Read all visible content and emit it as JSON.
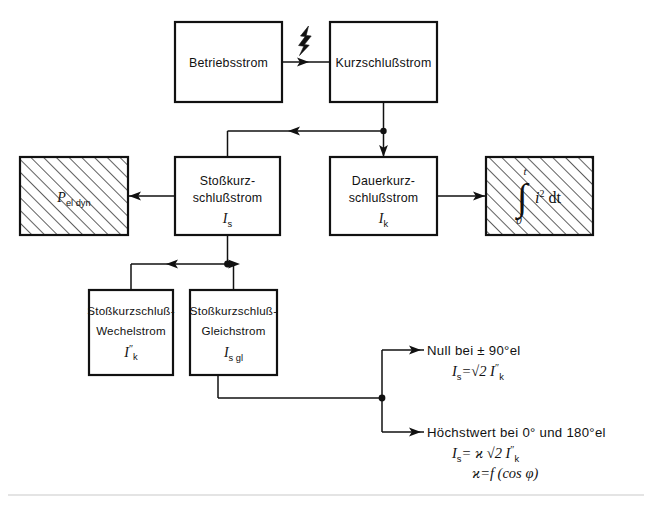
{
  "diagram": {
    "ink_color": "#111111",
    "background_color": "#ffffff",
    "boxes": {
      "betriebsstrom": {
        "label": "Betriebsstrom"
      },
      "kurzschlussstrom": {
        "label": "Kurzschlußstrom"
      },
      "p_el_dyn": {
        "symbol": "P",
        "subscript": "el dyn",
        "hatched": "true"
      },
      "stosskurzschlussstrom": {
        "line1": "Stoßkurz-",
        "line2": "schlußstrom",
        "symbol": "I",
        "subscript": "s"
      },
      "dauerkurzschlussstrom": {
        "line1": "Dauerkurz-",
        "line2": "schlußstrom",
        "symbol": "I",
        "subscript": "k"
      },
      "integral": {
        "sign": "∫",
        "upper_limit": "t",
        "lower_limit": "0",
        "integrand": "i",
        "exponent": "2",
        "differential": "dt",
        "hatched": "true"
      },
      "stosskurzschluss_wechselstrom": {
        "line1": "Stoßkurzschluß-",
        "line2": "Wechelstrom",
        "symbol": "I",
        "subscript": "k",
        "superscript": "″"
      },
      "stosskurzschluss_gleichstrom": {
        "line1": "Stoßkurzschluß-",
        "line2": "Gleichstrom",
        "symbol": "I",
        "subscript": "s gl"
      }
    },
    "annotations": {
      "null_case": {
        "heading": "Null  bei ± 90°el",
        "formula_symbol": "I",
        "formula_subscript": "s",
        "formula_rest": "=√2 I",
        "formula_sub2": "k",
        "formula_sup2": "″"
      },
      "max_case": {
        "heading": "Höchstwert  bei 0°  und  180°el",
        "formula_symbol": "I",
        "formula_subscript": "s",
        "formula_rest": "= ϰ √2 I",
        "formula_sub2": "k",
        "formula_sup2": "″",
        "formula_line2_symbol": "ϰ",
        "formula_line2_rest": "=f (cos φ)"
      }
    },
    "icons": {
      "lightning_bolt": "lightning-bolt-icon"
    }
  }
}
